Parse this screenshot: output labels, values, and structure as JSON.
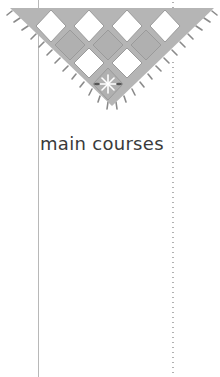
{
  "page": {
    "heading": "main courses"
  },
  "banner": {
    "icon": "checkered-triangle-pennant",
    "emblem_icon": "compass-star-icon",
    "colors": {
      "gray_tile": "#b5b5b5",
      "white_tile": "#ffffff",
      "border": "#9a9a9a"
    }
  },
  "rules": {
    "solid_line_color": "#b8b8b8",
    "dotted_line_color": "#b0b0b0"
  }
}
